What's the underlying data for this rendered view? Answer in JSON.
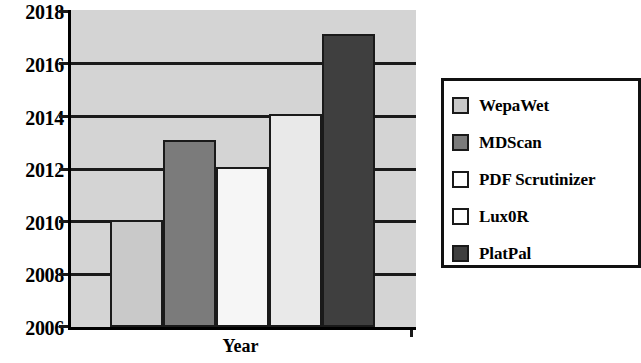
{
  "chart_data": {
    "type": "bar",
    "title": "",
    "xlabel": "Year",
    "ylabel": "",
    "ylim": [
      2006,
      2018
    ],
    "ytick_labels": [
      "2018",
      "2016",
      "2014",
      "2012",
      "2010",
      "2008",
      "2006"
    ],
    "ytick_values": [
      2018,
      2016,
      2014,
      2012,
      2010,
      2008,
      2006
    ],
    "grid": true,
    "legend_position": "right",
    "categories": [
      "WepaWet",
      "MDScan",
      "PDF Scrutinizer",
      "Lux0R",
      "PlatPal"
    ],
    "values": [
      2010,
      2013,
      2012,
      2014,
      2017
    ],
    "baseline": 2006,
    "series": [
      {
        "name": "Year of publication",
        "points": [
          {
            "label": "WepaWet",
            "value": 2010,
            "color": "#c9c9c9"
          },
          {
            "label": "MDScan",
            "value": 2013,
            "color": "#7b7b7b"
          },
          {
            "label": "PDF Scrutinizer",
            "value": 2012,
            "color": "#f6f6f6"
          },
          {
            "label": "Lux0R",
            "value": 2014,
            "color": "#e9e9e9"
          },
          {
            "label": "PlatPal",
            "value": 2017,
            "color": "#3f3f3f"
          }
        ]
      }
    ],
    "plot_background": "#d4d4d4",
    "axis_color": "#1a1a1a"
  },
  "legend": {
    "items": [
      {
        "label": "WepaWet",
        "color": "#c9c9c9"
      },
      {
        "label": "MDScan",
        "color": "#7b7b7b"
      },
      {
        "label": "PDF Scrutinizer",
        "color": "#ffffff"
      },
      {
        "label": "Lux0R",
        "color": "#ffffff"
      },
      {
        "label": "PlatPal",
        "color": "#3f3f3f"
      }
    ]
  },
  "axis": {
    "x_title": "Year"
  }
}
